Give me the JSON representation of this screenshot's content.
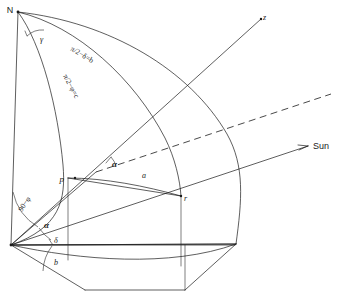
{
  "figure": {
    "background_color": "#ffffff",
    "line_color": "#1a1a1a",
    "width": 341,
    "height": 301
  },
  "points": {
    "north_pole": {
      "label": "N",
      "x": 18,
      "y": 12
    },
    "point_p": {
      "label": "p",
      "x": 68,
      "y": 178
    },
    "point_r": {
      "label": "r",
      "x": 181,
      "y": 196
    },
    "zenith_axis": {
      "label": "z",
      "x": 263,
      "y": 17
    },
    "sun_direction": {
      "label": "Sun",
      "x": 313,
      "y": 145
    },
    "origin": {
      "label": "",
      "x": 11,
      "y": 245
    }
  },
  "arc_labels": {
    "side_b": "π/2−δ=b",
    "side_c": "π/2−φ=c",
    "side_a": "a"
  },
  "angle_labels": {
    "gamma_at_pole": "γ",
    "alpha_at_p": "α",
    "alpha_at_origin": "α",
    "colatitude": "90−φ",
    "declination": "δ",
    "hour_side": "b"
  },
  "legend_text": {
    "sun_ray": "Sun",
    "zenith": "z",
    "pole": "N"
  }
}
